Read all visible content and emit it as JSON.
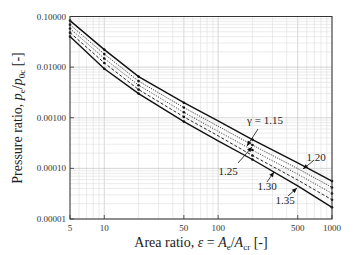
{
  "chart_data": {
    "type": "line",
    "title": "",
    "xlabel": "Area ratio, ε = A_e/A_cr [-]",
    "ylabel": "Pressure ratio, p_e/p_0c [-]",
    "xscale": "log",
    "yscale": "log",
    "xlim": [
      5,
      1000
    ],
    "ylim": [
      1e-05,
      0.1
    ],
    "grid": true,
    "x_ticks": [
      5,
      10,
      50,
      100,
      500,
      1000
    ],
    "x_tick_labels": [
      "5",
      "10",
      "50",
      "100",
      "500",
      "1000"
    ],
    "y_ticks": [
      1e-05,
      0.0001,
      0.001,
      0.01,
      0.1
    ],
    "y_tick_labels": [
      "0.00001",
      "0.00010",
      "0.00100",
      "0.01000",
      "0.10000"
    ],
    "x": [
      5,
      10,
      20,
      50,
      100,
      200,
      500,
      1000
    ],
    "series": [
      {
        "name": "γ = 1.15",
        "style": "solid",
        "values": [
          0.083,
          0.0222,
          0.0065,
          0.00198,
          0.00087,
          0.00037,
          0.000129,
          5.6e-05
        ]
      },
      {
        "name": "1.20",
        "style": "dotted-thin",
        "values": [
          0.069,
          0.0181,
          0.0053,
          0.00159,
          0.00068,
          0.00029,
          9.9e-05,
          4.2e-05
        ]
      },
      {
        "name": "1.25",
        "style": "dotted",
        "values": [
          0.058,
          0.0148,
          0.0044,
          0.00128,
          0.00054,
          0.00023,
          7.7e-05,
          3.2e-05
        ]
      },
      {
        "name": "1.30",
        "style": "dashed",
        "values": [
          0.048,
          0.0121,
          0.0036,
          0.00104,
          0.00044,
          0.00018,
          5.9e-05,
          2.4e-05
        ]
      },
      {
        "name": "1.35",
        "style": "solid",
        "values": [
          0.04,
          0.0093,
          0.003,
          0.00084,
          0.00035,
          0.00015,
          4.5e-05,
          1.7e-05
        ]
      }
    ],
    "annotations": [
      {
        "text": "γ = 1.15",
        "series": 0
      },
      {
        "text": "1.20",
        "series": 1
      },
      {
        "text": "1.25",
        "series": 2
      },
      {
        "text": "1.30",
        "series": 3
      },
      {
        "text": "1.35",
        "series": 4
      }
    ],
    "legend": "inline annotations with arrows"
  },
  "labels": {
    "xlabel_main": "Area ratio, ",
    "xlabel_eps": "ε",
    "xlabel_eq": " = ",
    "xlabel_A": "A",
    "xlabel_e": "e",
    "xlabel_slash": "/",
    "xlabel_A2": "A",
    "xlabel_cr": "cr",
    "xlabel_unit": " [-]",
    "ylabel_main": "Pressure ratio, ",
    "ylabel_p": "p",
    "ylabel_e": "e",
    "ylabel_slash": "/",
    "ylabel_p2": "p",
    "ylabel_0c": "0c",
    "ylabel_unit": " [-]"
  }
}
